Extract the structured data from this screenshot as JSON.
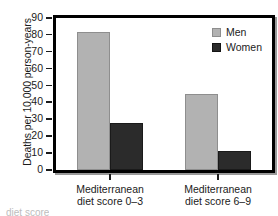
{
  "chart_data": {
    "type": "bar",
    "title": "",
    "xlabel": "",
    "ylabel": "Deaths per 10,000 person-years",
    "categories": [
      "Mediterranean diet score 0–3",
      "Mediterranean diet score 6–9"
    ],
    "category_lines": [
      [
        "Mediterranean",
        "diet score 0–3"
      ],
      [
        "Mediterranean",
        "diet score 6–9"
      ]
    ],
    "series": [
      {
        "name": "Men",
        "values": [
          82,
          45
        ],
        "color": "#b2b2b2"
      },
      {
        "name": "Women",
        "values": [
          28,
          11
        ],
        "color": "#2b2b2b"
      }
    ],
    "ylim": [
      0,
      90
    ],
    "ytick_values": [
      90,
      80,
      70,
      60,
      50,
      40,
      30,
      20,
      10,
      0
    ],
    "ytick_labels": [
      "90",
      "80",
      "70",
      "60",
      "50",
      "40",
      "30",
      "20",
      "10",
      "0"
    ],
    "ytick_step": 10,
    "grid": false,
    "legend_position": "top-right",
    "legend_entries": [
      {
        "label": "Men",
        "color": "#b2b2b2"
      },
      {
        "label": "Women",
        "color": "#2b2b2b"
      }
    ]
  },
  "figure": {
    "frame_color": "#000000",
    "background": "#ffffff",
    "caption_remnant": "diet score"
  }
}
